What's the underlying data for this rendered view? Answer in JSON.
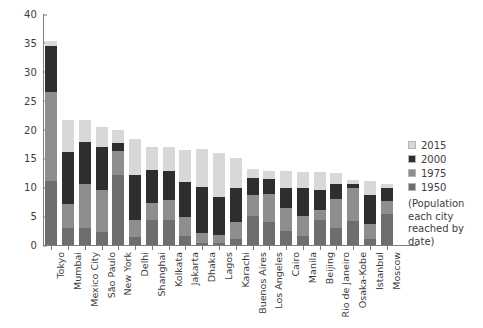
{
  "chart_data": {
    "type": "bar",
    "subtype": "stacked-bar",
    "title": "",
    "subtitle": "",
    "xlabel": "",
    "ylabel": "",
    "ylim": [
      0,
      40
    ],
    "yticks": [
      0,
      5,
      10,
      15,
      20,
      25,
      30,
      35,
      40
    ],
    "ytick_labels": [
      "0",
      "5",
      "10",
      "15",
      "20",
      "25",
      "30",
      "35",
      "40"
    ],
    "grid": false,
    "legend_position": "right",
    "units_note": "(Population each city reached by date)",
    "categories": [
      "Tokyo",
      "Mumbai",
      "Mexico City",
      "São Paulo",
      "New York",
      "Delhi",
      "Shanghai",
      "Kolkata",
      "Jakarta",
      "Dhaka",
      "Lagos",
      "Karachi",
      "Buenos Aires",
      "Los Angeles",
      "Cairo",
      "Manila",
      "Beijing",
      "Rio de Janeiro",
      "Osaka-Kobe",
      "Istanbul",
      "Moscow"
    ],
    "series": [
      {
        "name": "1950",
        "color": "#6e6e6e",
        "values": [
          11.3,
          2.9,
          2.9,
          2.3,
          12.3,
          1.4,
          4.3,
          4.5,
          1.5,
          0.3,
          0.3,
          1.0,
          5.1,
          4.0,
          2.5,
          1.5,
          4.3,
          3.0,
          4.1,
          1.0,
          5.4
        ]
      },
      {
        "name": "1975",
        "color": "#8e8e8e",
        "values": [
          26.6,
          7.1,
          10.7,
          9.6,
          15.9,
          4.4,
          7.3,
          7.9,
          4.8,
          2.2,
          1.9,
          4.0,
          8.7,
          8.9,
          6.4,
          5.0,
          6.0,
          7.9,
          9.8,
          3.6,
          7.6
        ]
      },
      {
        "name": "2000",
        "color": "#2e2e2e",
        "values": [
          34.4,
          16.1,
          18.0,
          17.0,
          17.8,
          15.7,
          13.9,
          13.1,
          8.4,
          10.3,
          7.3,
          10.0,
          12.4,
          11.8,
          13.6,
          10.8,
          10.2,
          11.3,
          11.2,
          8.7,
          10.0
        ]
      },
      {
        "name": "2015",
        "color": "#d8d8d8",
        "values": [
          38.0,
          21.7,
          21.6,
          21.1,
          18.6,
          25.7,
          23.7,
          14.9,
          10.3,
          17.6,
          13.1,
          16.6,
          15.2,
          12.3,
          18.8,
          13.0,
          20.4,
          12.9,
          20.2,
          14.2,
          12.2
        ]
      }
    ],
    "bar_tops": {
      "note": "cumulative displayed bar height per city (top of stack, millions)",
      "values": [
        35.3,
        21.7,
        21.6,
        20.4,
        19.9,
        18.3,
        17.0,
        17.0,
        16.5,
        16.6,
        15.9,
        15.0,
        13.2,
        12.8,
        12.8,
        12.7,
        12.7,
        12.4,
        11.2,
        11.1,
        10.6
      ]
    },
    "stack_boundaries": {
      "note": "cumulative y value at the TOP of each series band per city, in order 1950,1975,2000,2015",
      "Tokyo": [
        11.1,
        26.5,
        34.4,
        35.3
      ],
      "Mumbai": [
        2.9,
        7.1,
        16.1,
        21.7
      ],
      "Mexico City": [
        2.9,
        10.6,
        17.9,
        21.6
      ],
      "São Paulo": [
        2.3,
        9.6,
        17.0,
        20.4
      ],
      "New York": [
        12.2,
        16.2,
        17.7,
        19.9
      ],
      "Delhi": [
        1.4,
        4.4,
        12.2,
        18.3
      ],
      "Shanghai": [
        4.3,
        7.2,
        13.0,
        17.0
      ],
      "Kolkata": [
        4.3,
        7.8,
        12.8,
        17.0
      ],
      "Jakarta": [
        1.6,
        4.9,
        10.9,
        16.5
      ],
      "Dhaka": [
        0.4,
        2.0,
        10.0,
        16.6
      ],
      "Lagos": [
        0.3,
        1.7,
        8.3,
        15.9
      ],
      "Karachi": [
        1.1,
        4.0,
        9.8,
        15.0
      ],
      "Buenos Aires": [
        5.1,
        8.7,
        11.6,
        13.2
      ],
      "Los Angeles": [
        4.0,
        8.9,
        11.5,
        12.8
      ],
      "Cairo": [
        2.5,
        6.4,
        9.9,
        12.8
      ],
      "Manila": [
        1.5,
        5.0,
        9.8,
        12.7
      ],
      "Beijing": [
        4.3,
        6.0,
        9.6,
        12.7
      ],
      "Rio de Janeiro": [
        3.0,
        7.9,
        10.5,
        12.4
      ],
      "Osaka-Kobe": [
        4.1,
        9.8,
        10.6,
        11.2
      ],
      "Istanbul": [
        1.0,
        3.6,
        8.7,
        11.1
      ],
      "Moscow": [
        5.4,
        7.6,
        9.8,
        10.6
      ]
    },
    "legend_entries": [
      {
        "label": "2015",
        "color": "#d8d8d8"
      },
      {
        "label": "2000",
        "color": "#2e2e2e"
      },
      {
        "label": "1975",
        "color": "#8e8e8e"
      },
      {
        "label": "1950",
        "color": "#6e6e6e"
      }
    ]
  },
  "legend": {
    "note_line1": "(Population",
    "note_line2": "each city",
    "note_line3": "reached by",
    "note_line4": "date)"
  }
}
